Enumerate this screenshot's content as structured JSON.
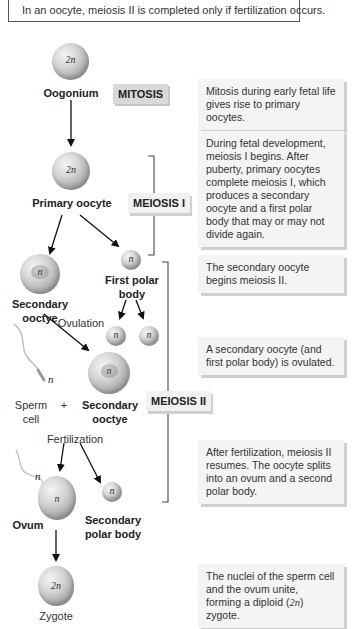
{
  "header": {
    "text": "In an oocyte, meiosis II is completed only if fertilization occurs."
  },
  "stages": {
    "mitosis": "MITOSIS",
    "meiosis1": "MEIOSIS I",
    "meiosis2": "MEIOSIS II"
  },
  "cells": {
    "oogonium": {
      "label": "Oogonium",
      "ploidy": "2n"
    },
    "primary_oocyte": {
      "label": "Primary oocyte",
      "ploidy": "2n"
    },
    "secondary_oocyte_1": {
      "label_line1": "Secondary",
      "label_line2": "ooctye",
      "ploidy": "n"
    },
    "first_polar_body": {
      "label_line1": "First polar",
      "label_line2": "body",
      "ploidy": "n"
    },
    "polar_division_a": {
      "ploidy": "n"
    },
    "polar_division_b": {
      "ploidy": "n"
    },
    "secondary_oocyte_2": {
      "label_line1": "Secondary",
      "label_line2": "ooctye",
      "ploidy": "n"
    },
    "sperm": {
      "label_line1": "Sperm",
      "label_line2": "cell",
      "ploidy": "n",
      "plus": "+"
    },
    "ovum": {
      "label": "Ovum",
      "ploidy": "n",
      "sperm_ploidy": "n"
    },
    "second_polar_body": {
      "label_line1": "Secondary",
      "label_line2": "polar body",
      "ploidy": "n"
    },
    "zygote": {
      "label": "Zygote",
      "ploidy": "2n"
    }
  },
  "events": {
    "ovulation": "Ovulation",
    "fertilization": "Fertilization"
  },
  "descriptions": [
    "Mitosis during early fetal life gives rise to primary oocytes.",
    "During fetal development, meiosis I begins. After puberty, primary oocytes complete meiosis I, which produces a secondary oocyte and a first polar body that may or may not divide again.",
    "The secondary oocyte begins meiosis II.",
    "A secondary oocyte (and first polar body) is ovulated.",
    "After fertilization, meiosis II resumes. The oocyte splits into an ovum and a second polar body.",
    {
      "pre": "The nuclei of the sperm cell and the ovum unite, forming a diploid (",
      "ital": "2n",
      "post": ") zygote."
    }
  ]
}
